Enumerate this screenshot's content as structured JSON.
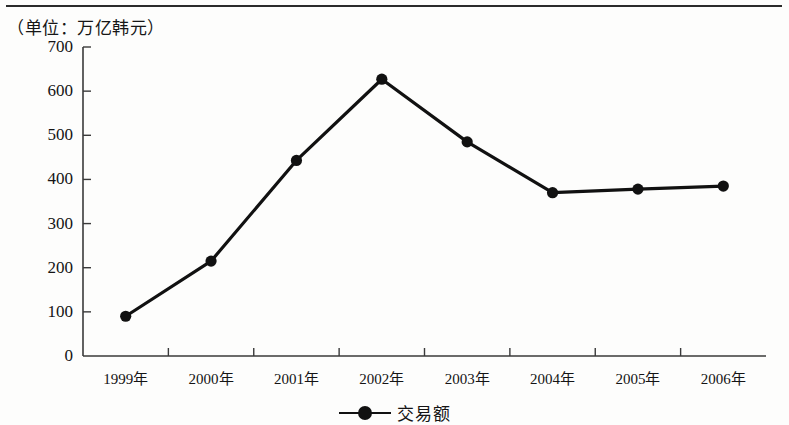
{
  "page": {
    "unit_title": "（单位：万亿韩元）"
  },
  "chart_data": {
    "type": "line",
    "title": "（单位：万亿韩元）",
    "xlabel": "",
    "ylabel": "",
    "categories": [
      "1999年",
      "2000年",
      "2001年",
      "2002年",
      "2003年",
      "2004年",
      "2005年",
      "2006年"
    ],
    "series": [
      {
        "name": "交易额",
        "values": [
          90,
          215,
          443,
          627,
          485,
          370,
          378,
          385
        ]
      }
    ],
    "ylim": [
      0,
      700
    ],
    "yticks": [
      0,
      100,
      200,
      300,
      400,
      500,
      600,
      700
    ],
    "ytick_labels": [
      "0",
      "100",
      "200",
      "300",
      "400",
      "500",
      "600",
      "700"
    ],
    "grid": false,
    "legend": {
      "position": "bottom-center",
      "entries": [
        "交易额"
      ]
    },
    "marker": "filled-circle",
    "line_color": "#111111",
    "marker_color": "#111111",
    "axis_color": "#3a3a3a"
  }
}
